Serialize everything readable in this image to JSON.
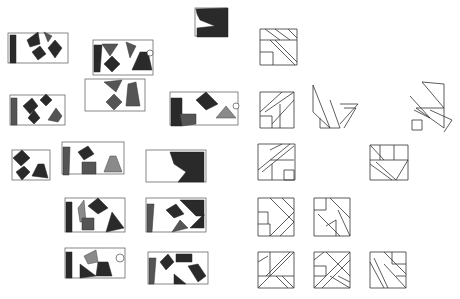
{
  "colors": {
    "paper": "#ffffff",
    "graphite_dark": "#2a2a2a",
    "graphite_mid": "#555555",
    "line": "#333333"
  },
  "shaded_studies": [
    {
      "id": "s1",
      "x": 8,
      "y": 33,
      "w": 60,
      "h": 30,
      "shapes": [
        {
          "t": "poly",
          "c": "dark",
          "p": "10,35 16,35 16,63 10,63"
        },
        {
          "t": "poly",
          "c": "dark",
          "p": "27,40 38,32 40,44 30,47"
        },
        {
          "t": "poly",
          "c": "dark",
          "p": "32,52 40,46 46,54 38,60"
        },
        {
          "t": "poly",
          "c": "dark",
          "p": "48,48 55,40 62,48 55,58"
        },
        {
          "t": "poly",
          "c": "mid",
          "p": "44,32 52,36 48,42"
        }
      ]
    },
    {
      "id": "s2",
      "x": 93,
      "y": 40,
      "w": 60,
      "h": 35,
      "shapes": [
        {
          "t": "poly",
          "c": "dark",
          "p": "94,45 102,45 100,72 94,72"
        },
        {
          "t": "poly",
          "c": "mid",
          "p": "102,44 118,44 110,56"
        },
        {
          "t": "poly",
          "c": "dark",
          "p": "104,64 112,56 120,64 112,72"
        },
        {
          "t": "poly",
          "c": "mid",
          "p": "126,42 136,46 130,58"
        },
        {
          "t": "poly",
          "c": "dark",
          "p": "132,70 140,52 148,52 152,70"
        },
        {
          "t": "circ",
          "cx": 150,
          "cy": 53,
          "r": 3
        }
      ]
    },
    {
      "id": "s3",
      "x": 85,
      "y": 79,
      "w": 60,
      "h": 32,
      "shapes": [
        {
          "t": "poly",
          "c": "mid",
          "p": "104,82 122,80 116,92"
        },
        {
          "t": "poly",
          "c": "mid",
          "p": "106,102 114,94 122,102 114,110"
        },
        {
          "t": "poly",
          "c": "mid",
          "p": "128,84 136,82 140,106 126,106"
        }
      ]
    },
    {
      "id": "s4",
      "x": 195,
      "y": 8,
      "w": 32,
      "h": 28,
      "shapes": [
        {
          "t": "poly",
          "c": "dark",
          "p": "196,9 228,8 228,37 197,37 197,28 215,26 200,20 197,14"
        }
      ]
    },
    {
      "id": "s5",
      "x": 10,
      "y": 95,
      "w": 55,
      "h": 30,
      "shapes": [
        {
          "t": "poly",
          "c": "mid",
          "p": "11,98 17,98 17,125 11,125"
        },
        {
          "t": "poly",
          "c": "dark",
          "p": "23,106 32,98 38,106 30,114"
        },
        {
          "t": "poly",
          "c": "dark",
          "p": "40,100 46,94 52,100 46,106"
        },
        {
          "t": "poly",
          "c": "dark",
          "p": "28,118 34,110 40,118 34,124"
        },
        {
          "t": "poly",
          "c": "mid",
          "p": "48,120 56,108 62,116 58,122"
        }
      ]
    },
    {
      "id": "s6",
      "x": 170,
      "y": 92,
      "w": 68,
      "h": 33,
      "shapes": [
        {
          "t": "poly",
          "c": "dark",
          "p": "171,98 182,98 182,126 171,126"
        },
        {
          "t": "poly",
          "c": "mid",
          "p": "180,114 196,114 196,124 182,126"
        },
        {
          "t": "poly",
          "c": "dark",
          "p": "196,100 206,92 218,104 206,110"
        },
        {
          "t": "poly",
          "c": "light",
          "p": "216,118 226,106 236,118"
        },
        {
          "t": "circ",
          "cx": 236,
          "cy": 106,
          "r": 3
        }
      ]
    },
    {
      "id": "s7",
      "x": 12,
      "y": 150,
      "w": 38,
      "h": 30,
      "shapes": [
        {
          "t": "poly",
          "c": "dark",
          "p": "13,158 22,150 30,158 21,166"
        },
        {
          "t": "poly",
          "c": "dark",
          "p": "16,172 24,166 30,172 22,180"
        },
        {
          "t": "poly",
          "c": "dark",
          "p": "32,176 38,164 44,164 48,178"
        }
      ]
    },
    {
      "id": "s8",
      "x": 62,
      "y": 142,
      "w": 62,
      "h": 32,
      "shapes": [
        {
          "t": "poly",
          "c": "mid",
          "p": "63,147 70,147 69,175 63,175"
        },
        {
          "t": "poly",
          "c": "dark",
          "p": "78,152 88,146 94,154 84,160"
        },
        {
          "t": "poly",
          "c": "mid",
          "p": "82,162 96,162 96,174 82,174"
        },
        {
          "t": "poly",
          "c": "light",
          "p": "104,172 110,156 116,156 122,172"
        }
      ]
    },
    {
      "id": "s9",
      "x": 146,
      "y": 150,
      "w": 60,
      "h": 32,
      "shapes": [
        {
          "t": "poly",
          "c": "dark",
          "p": "170,152 204,152 204,182 178,182 186,172 174,164"
        }
      ]
    },
    {
      "id": "s10",
      "x": 65,
      "y": 198,
      "w": 60,
      "h": 34,
      "shapes": [
        {
          "t": "poly",
          "c": "dark",
          "p": "66,202 72,202 72,232 66,232"
        },
        {
          "t": "poly",
          "c": "light",
          "p": "78,208 84,200 86,222 80,222"
        },
        {
          "t": "poly",
          "c": "dark",
          "p": "88,206 98,198 108,208 98,214"
        },
        {
          "t": "poly",
          "c": "mid",
          "p": "82,218 94,218 94,230 82,230"
        },
        {
          "t": "poly",
          "c": "dark",
          "p": "106,232 112,212 124,228"
        }
      ]
    },
    {
      "id": "s11",
      "x": 146,
      "y": 198,
      "w": 60,
      "h": 34,
      "shapes": [
        {
          "t": "poly",
          "c": "mid",
          "p": "147,204 154,204 152,232 147,232"
        },
        {
          "t": "poly",
          "c": "dark",
          "p": "166,210 176,204 184,214 174,218"
        },
        {
          "t": "poly",
          "c": "dark",
          "p": "180,200 204,200 204,216 196,216"
        },
        {
          "t": "poly",
          "c": "mid",
          "p": "172,232 180,220 188,228"
        },
        {
          "t": "poly",
          "c": "dark",
          "p": "190,228 204,214 204,228"
        }
      ]
    },
    {
      "id": "s12",
      "x": 65,
      "y": 248,
      "w": 60,
      "h": 30,
      "shapes": [
        {
          "t": "poly",
          "c": "dark",
          "p": "66,252 72,252 72,278 66,278"
        },
        {
          "t": "poly",
          "c": "light",
          "p": "84,256 96,250 98,262 88,264"
        },
        {
          "t": "poly",
          "c": "dark",
          "p": "80,264 96,276 80,278"
        },
        {
          "t": "poly",
          "c": "dark",
          "p": "98,262 108,262 112,276 96,276"
        },
        {
          "t": "circ",
          "cx": 120,
          "cy": 258,
          "r": 4
        }
      ]
    },
    {
      "id": "s13",
      "x": 148,
      "y": 252,
      "w": 60,
      "h": 32,
      "shapes": [
        {
          "t": "poly",
          "c": "mid",
          "p": "149,258 156,258 154,284 149,284"
        },
        {
          "t": "poly",
          "c": "dark",
          "p": "160,262 168,254 174,262 166,270"
        },
        {
          "t": "poly",
          "c": "dark",
          "p": "176,254 192,254 192,262 176,262"
        },
        {
          "t": "poly",
          "c": "dark",
          "p": "188,266 198,264 206,276 198,282"
        },
        {
          "t": "poly",
          "c": "dark",
          "p": "174,274 186,284 174,284"
        }
      ]
    }
  ],
  "line_studies": [
    {
      "id": "l1",
      "lines": [
        "260,29 297,29 297,65 260,65 260,29",
        "260,40 297,40",
        "265,29 280,40",
        "275,29 290,40",
        "270,40 295,65",
        "275,40 297,62",
        "260,52 273,52 273,65",
        "288,29 297,38"
      ]
    },
    {
      "id": "l2",
      "lines": [
        "260,92 294,92 294,128 260,128 260,92",
        "260,112 282,92",
        "265,112 294,92",
        "272,116 272,128",
        "294,100 272,124",
        "280,104 280,128",
        "260,116 272,116"
      ]
    },
    {
      "id": "l3",
      "lines": [
        "313,85 330,128 313,112 313,85",
        "320,118 320,128 330,128",
        "330,100 340,128 330,128",
        "340,104 358,104 340,124",
        "344,108 356,108 344,128"
      ]
    },
    {
      "id": "l4",
      "lines": [
        "422,82 444,84 444,108 422,82",
        "410,96 430,118 414,110",
        "416,108 444,108 444,128 416,108",
        "430,110 452,120 444,132",
        "412,120 422,120 422,130 412,130 412,120"
      ]
    },
    {
      "id": "l5",
      "lines": [
        "258,144 295,144 295,180 258,180 258,144",
        "258,170 290,144",
        "262,172 294,146",
        "270,160 294,160",
        "272,164 272,180",
        "284,170 294,170 294,180 284,180 284,170",
        "270,150 282,144"
      ]
    },
    {
      "id": "l6",
      "lines": [
        "370,145 408,145 408,180 370,180 370,145",
        "370,160 408,160",
        "380,145 380,160",
        "394,145 394,160",
        "370,164 392,180",
        "376,162 396,180",
        "408,160 396,180",
        "370,145 384,160"
      ]
    },
    {
      "id": "l7",
      "lines": [
        "258,198 294,198 294,236 258,236 258,198",
        "270,198 294,222",
        "282,198 294,210",
        "258,224 270,224 270,236",
        "258,212 268,212 268,224",
        "270,236 294,212",
        "280,236 294,222"
      ]
    },
    {
      "id": "l8",
      "lines": [
        "314,198 350,198 350,236 314,236 314,198",
        "314,210 326,210 326,198",
        "318,214 340,236",
        "330,198 350,218",
        "338,210 350,236",
        "326,226 336,220 336,236"
      ]
    },
    {
      "id": "l9",
      "lines": [
        "258,252 294,252 294,288 258,288 258,252",
        "270,252 270,276",
        "258,276 294,276",
        "294,252 270,276",
        "290,252 266,276",
        "258,262 268,256",
        "276,276 288,288",
        "282,276 294,288",
        "258,288 270,276"
      ]
    },
    {
      "id": "l10",
      "lines": [
        "314,252 350,252 350,288 314,288 314,252",
        "314,266 326,266 326,276 314,276",
        "326,252 350,276",
        "314,288 350,252",
        "322,288 350,260",
        "314,260 324,252",
        "330,276 350,288",
        "338,276 350,282"
      ]
    },
    {
      "id": "l11",
      "lines": [
        "370,252 406,252 406,288 370,288 370,252",
        "384,252 406,274",
        "392,252 392,264 406,264",
        "370,262 384,288",
        "374,258 388,288",
        "384,264 406,288",
        "396,276 406,276"
      ]
    }
  ]
}
